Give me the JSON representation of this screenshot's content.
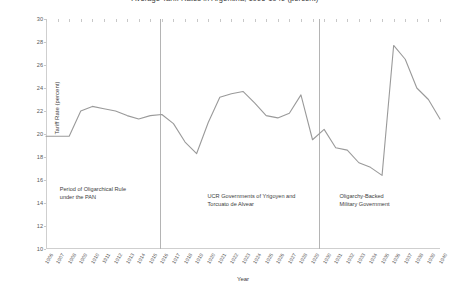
{
  "chart_data": {
    "type": "line",
    "title": "Average Tariff Rates in Argentina, 1906-1940 (percent)",
    "xlabel": "Year",
    "ylabel": "Tariff Rate (percent)",
    "ylim": [
      10,
      30
    ],
    "ytick_step": 2,
    "yticks": [
      "10",
      "12",
      "14",
      "16",
      "18",
      "20",
      "22",
      "24",
      "26",
      "28",
      "30"
    ],
    "grid": false,
    "legend": "none",
    "line_color": "#9a9a9a",
    "series_name": "Tariff Rate",
    "categories": [
      "1906",
      "1907",
      "1908",
      "1909",
      "1910",
      "1911",
      "1912",
      "1913",
      "1914",
      "1915",
      "1916",
      "1917",
      "1918",
      "1919",
      "1920",
      "1921",
      "1922",
      "1923",
      "1924",
      "1925",
      "1926",
      "1927",
      "1928",
      "1929",
      "1930",
      "1931",
      "1932",
      "1933",
      "1934",
      "1935",
      "1936",
      "1937",
      "1938",
      "1939",
      "1940"
    ],
    "values": [
      19.8,
      19.8,
      19.8,
      22.0,
      22.4,
      22.2,
      22.0,
      21.6,
      21.3,
      21.6,
      21.7,
      20.9,
      19.3,
      18.3,
      21.0,
      23.2,
      23.5,
      23.7,
      22.7,
      21.6,
      21.4,
      21.8,
      23.4,
      19.5,
      20.4,
      18.8,
      18.6,
      17.5,
      17.1,
      16.4,
      27.7,
      26.5,
      24.0,
      23.0,
      21.3
    ],
    "annotations": [
      {
        "name": "oligarchical-rule",
        "text": "Period of Oligarchical Rule\nunder the PAN",
        "x_pct": 3.5,
        "y_pct": 72.0
      },
      {
        "name": "ucr-governments",
        "text": "UCR Governments of Yrigoyen and\nTorcuato de Alvear",
        "x_pct": 41.0,
        "y_pct": 75.0
      },
      {
        "name": "military-government",
        "text": "Oligarchy-Backed\nMilitary Government",
        "x_pct": 74.5,
        "y_pct": 75.0
      }
    ],
    "dividers": [
      {
        "name": "divider-1916",
        "year": "1916",
        "x_pct": 28.9
      },
      {
        "name": "divider-1930",
        "year": "1930",
        "x_pct": 69.2
      }
    ]
  }
}
